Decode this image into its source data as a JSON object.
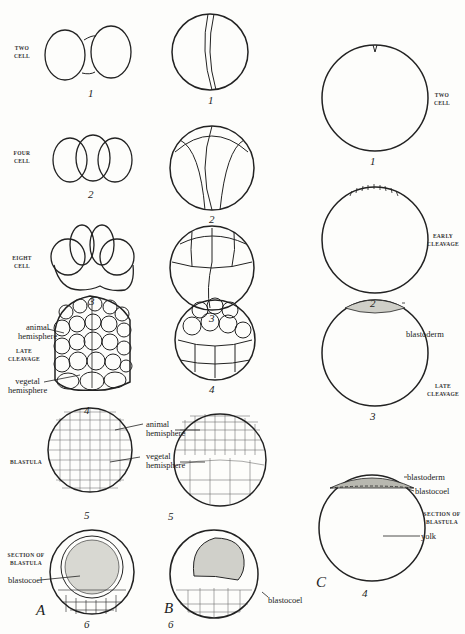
{
  "figure": {
    "columns": [
      {
        "letter": "A",
        "stages": [
          {
            "number": "1",
            "label_line1": "TWO",
            "label_line2": "CELL"
          },
          {
            "number": "2",
            "label_line1": "FOUR",
            "label_line2": "CELL"
          },
          {
            "number": "3",
            "label_line1": "EIGHT",
            "label_line2": "CELL"
          },
          {
            "number": "4",
            "label_line1": "LATE",
            "label_line2": "CLEAVAGE",
            "annotations": [
              "animal",
              "hemisphere",
              "vegetal",
              "hemisphere"
            ]
          },
          {
            "number": "5",
            "label_line1": "BLASTULA",
            "label_line2": ""
          },
          {
            "number": "6",
            "label_line1": "SECTION OF",
            "label_line2": "BLASTULA",
            "annotations": [
              "blastocoel"
            ]
          }
        ]
      },
      {
        "letter": "B",
        "stages": [
          {
            "number": "1"
          },
          {
            "number": "2"
          },
          {
            "number": "3"
          },
          {
            "number": "4"
          },
          {
            "number": "5",
            "annotations": [
              "animal",
              "hemisphere",
              "vegetal",
              "hemisphere"
            ]
          },
          {
            "number": "6",
            "annotations": [
              "blastocoel"
            ]
          }
        ]
      },
      {
        "letter": "C",
        "stages": [
          {
            "number": "1",
            "label_line1": "TWO",
            "label_line2": "CELL"
          },
          {
            "number": "2",
            "label_line1": "EARLY",
            "label_line2": "CLEAVAGE"
          },
          {
            "number": "3",
            "label_line1": "LATE",
            "label_line2": "CLEAVAGE",
            "annotations": [
              "blastoderm"
            ]
          },
          {
            "number": "4",
            "label_line1": "SECTION OF",
            "label_line2": "BLASTULA",
            "annotations": [
              "blastoderm",
              "blastocoel",
              "yolk"
            ]
          }
        ]
      }
    ]
  }
}
